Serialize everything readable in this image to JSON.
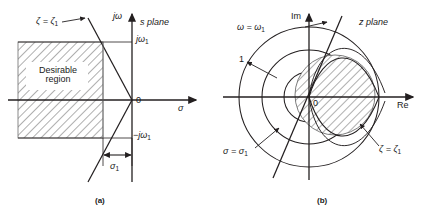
{
  "figure": {
    "panels": [
      {
        "id": "a",
        "caption": "(a)",
        "plane_title": "s plane",
        "axis_vertical": "jω",
        "axis_horizontal": "σ",
        "origin": "0",
        "ticks": {
          "upper": "jω",
          "upper_sub": "1",
          "lower": "−jω",
          "lower_sub": "1"
        },
        "damping_label": "ζ = ζ",
        "damping_sub": "1",
        "dimension_label": "σ",
        "dimension_sub": "1",
        "region_label_line1": "Desirable",
        "region_label_line2": "region"
      },
      {
        "id": "b",
        "caption": "(b)",
        "plane_title": "z plane",
        "axis_vertical": "Im",
        "axis_horizontal": "Re",
        "origin": "0",
        "unit_radius": "1",
        "frequency_label": "ω = ω",
        "frequency_sub": "1",
        "sigma_label": "σ = σ",
        "sigma_sub": "1",
        "damping_label": "ζ = ζ",
        "damping_sub": "1"
      }
    ]
  },
  "colors": {
    "line": "#231f20",
    "hatch": "#6d6d6d",
    "hatch_fill": "#ffffff",
    "background": "#ffffff"
  }
}
